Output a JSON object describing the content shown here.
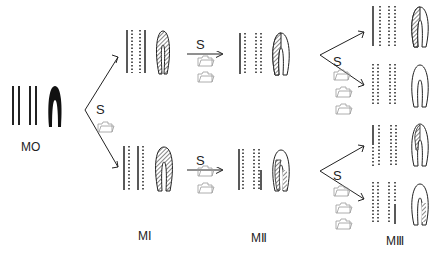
{
  "diagram": {
    "type": "chromosome-replication-segregation",
    "stage_labels": {
      "m0": "MO",
      "m1": "MⅠ",
      "m2": "MⅡ",
      "m3": "MⅢ"
    },
    "transition_label": "S",
    "legend": {
      "solid_line": "parental strand",
      "dotted_line": "newly synthesized strand",
      "filled_chromatid": "labeled",
      "hatched_chromatid": "partially labeled",
      "open_chromatid": "unlabeled"
    },
    "icons": {
      "folder_glyph": "folder-icon"
    },
    "colors": {
      "ink": "#222222",
      "hatch": "#666666",
      "folder": "#9a9a9a"
    }
  }
}
